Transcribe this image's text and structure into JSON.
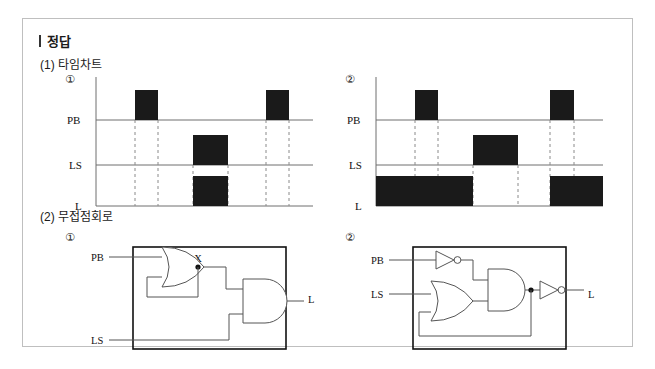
{
  "document": {
    "title": "정답",
    "title_marker": "|",
    "sections": [
      {
        "id": "timing",
        "label": "(1) 타임차트"
      },
      {
        "id": "logic",
        "label": "(2) 무접점회로"
      }
    ]
  },
  "colors": {
    "card_border": "#bfbfbf",
    "pulse_fill": "#1a1a1a",
    "axis": "#6e6e6e",
    "dashed_guide": "#8a8a8a",
    "wire": "#555555",
    "circuit_box_border": "#111111",
    "text": "#1a1a1a",
    "background": "#ffffff"
  },
  "timing_charts": [
    {
      "number": "①",
      "signals": [
        {
          "name": "PB",
          "baseline_label": "PB"
        },
        {
          "name": "LS",
          "baseline_label": "LS"
        },
        {
          "name": "L",
          "baseline_label": "L"
        }
      ],
      "axis": {
        "x_start": 0,
        "x_end": 220,
        "time_units": 10
      },
      "pulses": {
        "PB": [
          {
            "start": 2.6,
            "end": 4.0
          },
          {
            "start": 15.2,
            "end": 16.6
          }
        ],
        "LS": [
          {
            "start": 8.6,
            "end": 12.5
          }
        ],
        "L": [
          {
            "start": 8.6,
            "end": 12.5
          }
        ]
      },
      "guides": [
        2.6,
        4.0,
        8.6,
        12.5,
        15.2,
        16.6
      ]
    },
    {
      "number": "②",
      "signals": [
        {
          "name": "PB",
          "baseline_label": "PB"
        },
        {
          "name": "LS",
          "baseline_label": "LS"
        },
        {
          "name": "L",
          "baseline_label": "L"
        }
      ],
      "axis": {
        "x_start": 0,
        "x_end": 220,
        "time_units": 10
      },
      "pulses": {
        "PB": [
          {
            "start": 2.6,
            "end": 4.0
          },
          {
            "start": 15.2,
            "end": 16.6
          }
        ],
        "LS": [
          {
            "start": 8.6,
            "end": 12.5
          }
        ],
        "L": [
          {
            "start": 0.0,
            "end": 8.6
          },
          {
            "start": 15.2,
            "end": 19.4
          }
        ]
      },
      "guides": [
        2.6,
        4.0,
        8.6,
        12.5,
        15.2,
        16.6
      ]
    }
  ],
  "circuits": [
    {
      "number": "①",
      "inputs": [
        {
          "label": "PB"
        },
        {
          "label": "LS"
        }
      ],
      "nodes": [
        {
          "label": "X"
        }
      ],
      "outputs": [
        {
          "label": "L"
        }
      ],
      "gates": [
        {
          "type": "or",
          "inputs": [
            "PB",
            "feedback-X"
          ],
          "output": "X"
        },
        {
          "type": "and",
          "inputs": [
            "X",
            "LS"
          ],
          "output": "L"
        }
      ]
    },
    {
      "number": "②",
      "inputs": [
        {
          "label": "PB"
        },
        {
          "label": "LS"
        }
      ],
      "nodes": [
        {
          "label": "X"
        }
      ],
      "outputs": [
        {
          "label": "L"
        }
      ],
      "gates": [
        {
          "type": "not",
          "inputs": [
            "PB"
          ],
          "output": "PB-bar"
        },
        {
          "type": "or",
          "inputs": [
            "LS",
            "feedback-X"
          ],
          "output": "or-out"
        },
        {
          "type": "and",
          "inputs": [
            "PB-bar",
            "or-out"
          ],
          "output": "X"
        },
        {
          "type": "not",
          "inputs": [
            "X"
          ],
          "output": "L"
        }
      ]
    }
  ]
}
